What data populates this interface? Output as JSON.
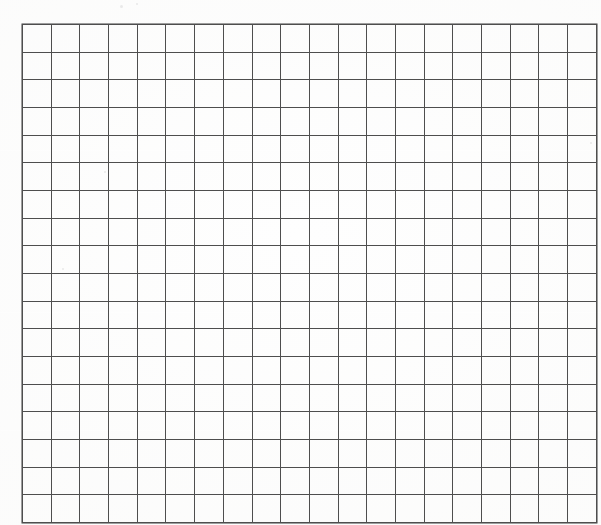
{
  "document": {
    "kind": "scanned-grid-sheet",
    "title": "Blank Grid Sheet",
    "description": "A blank scanned sheet of square grid (graph) paper with no writing, labels, or markings."
  },
  "page": {
    "width_px": 601,
    "height_px": 525,
    "background_color": "#fefefe",
    "margin_color": "#ffffff"
  },
  "grid": {
    "columns": 20,
    "rows": 18,
    "origin_x_px": 22,
    "origin_y_px": 24,
    "width_px": 554,
    "height_px": 480,
    "cell_width_px": 27.7,
    "cell_height_px": 26.7,
    "line_color": "#4e4e4e",
    "border_color": "#3f3f3f",
    "line_width_px": 1,
    "cell_fill_color": "transparent",
    "cell_text": ""
  },
  "artifacts": {
    "specks": [
      {
        "x_px": 120,
        "y_px": 5,
        "size_px": 3
      },
      {
        "x_px": 136,
        "y_px": 3,
        "size_px": 2
      },
      {
        "x_px": 104,
        "y_px": 171,
        "size_px": 2
      },
      {
        "x_px": 62,
        "y_px": 268,
        "size_px": 2
      },
      {
        "x_px": 590,
        "y_px": 142,
        "size_px": 2
      }
    ],
    "bands": [
      {
        "y_px": 150
      },
      {
        "y_px": 312
      },
      {
        "y_px": 430
      }
    ]
  },
  "content": {
    "has_text": false,
    "has_drawings": false,
    "visible_labels": []
  }
}
